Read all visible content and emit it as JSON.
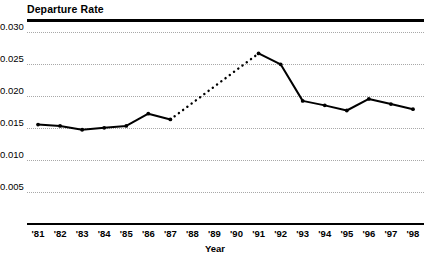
{
  "chart_data": {
    "type": "line",
    "title": "Departure Rate",
    "xlabel": "Year",
    "ylabel": "",
    "grid": true,
    "legend": false,
    "xlim": [
      1980.5,
      1998.5
    ],
    "ylim": [
      0.0,
      0.0315
    ],
    "ytick_labels": [
      "0.030",
      "0.025",
      "0.020",
      "0.015",
      "0.010",
      "0.005"
    ],
    "ytick_values": [
      0.03,
      0.025,
      0.02,
      0.015,
      0.01,
      0.005
    ],
    "categories": [
      "'81",
      "'82",
      "'83",
      "'84",
      "'85",
      "'86",
      "'87",
      "'88",
      "'89",
      "'90",
      "'91",
      "'92",
      "'93",
      "'94",
      "'95",
      "'96",
      "'97",
      "'98"
    ],
    "x": [
      1981,
      1982,
      1983,
      1984,
      1985,
      1986,
      1987,
      1988,
      1989,
      1990,
      1991,
      1992,
      1993,
      1994,
      1995,
      1996,
      1997,
      1998
    ],
    "values": [
      0.0155,
      0.0153,
      0.0147,
      0.015,
      0.0153,
      0.0172,
      0.0163,
      null,
      null,
      null,
      0.0266,
      0.0249,
      0.0192,
      0.0185,
      0.0177,
      0.0195,
      0.0187,
      0.0179
    ],
    "series": [
      {
        "name": "Departure Rate",
        "style": "solid",
        "color": "#000000",
        "markers": true,
        "x": [
          1981,
          1982,
          1983,
          1984,
          1985,
          1986,
          1987
        ],
        "values": [
          0.0155,
          0.0153,
          0.0147,
          0.015,
          0.0153,
          0.0172,
          0.0163
        ]
      },
      {
        "name": "Departure Rate (interpolated 1987-1991)",
        "style": "dashed",
        "color": "#000000",
        "markers": false,
        "x": [
          1987,
          1991
        ],
        "values": [
          0.0163,
          0.0266
        ]
      },
      {
        "name": "Departure Rate (1991-1998)",
        "style": "solid",
        "color": "#000000",
        "markers": true,
        "x": [
          1991,
          1992,
          1993,
          1994,
          1995,
          1996,
          1997,
          1998
        ],
        "values": [
          0.0266,
          0.0249,
          0.0192,
          0.0185,
          0.0177,
          0.0195,
          0.0187,
          0.0179
        ]
      }
    ]
  },
  "header": {
    "title": "Departure Rate"
  },
  "axes": {
    "x_title": "Year",
    "y_ticks": [
      {
        "label": "0.030",
        "value": 0.03
      },
      {
        "label": "0.025",
        "value": 0.025
      },
      {
        "label": "0.020",
        "value": 0.02
      },
      {
        "label": "0.015",
        "value": 0.015
      },
      {
        "label": "0.010",
        "value": 0.01
      },
      {
        "label": "0.005",
        "value": 0.005
      }
    ],
    "x_ticks": [
      {
        "label": "'81",
        "value": 1981
      },
      {
        "label": "'82",
        "value": 1982
      },
      {
        "label": "'83",
        "value": 1983
      },
      {
        "label": "'84",
        "value": 1984
      },
      {
        "label": "'85",
        "value": 1985
      },
      {
        "label": "'86",
        "value": 1986
      },
      {
        "label": "'87",
        "value": 1987
      },
      {
        "label": "'88",
        "value": 1988
      },
      {
        "label": "'89",
        "value": 1989
      },
      {
        "label": "'90",
        "value": 1990
      },
      {
        "label": "'91",
        "value": 1991
      },
      {
        "label": "'92",
        "value": 1992
      },
      {
        "label": "'93",
        "value": 1993
      },
      {
        "label": "'94",
        "value": 1994
      },
      {
        "label": "'95",
        "value": 1995
      },
      {
        "label": "'96",
        "value": 1996
      },
      {
        "label": "'97",
        "value": 1997
      },
      {
        "label": "'98",
        "value": 1998
      }
    ]
  },
  "colors": {
    "line": "#000000",
    "grid": "#a8a8a8",
    "axis": "#000000",
    "background": "#ffffff"
  }
}
